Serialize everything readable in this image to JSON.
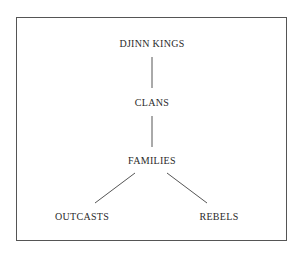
{
  "diagram": {
    "type": "hierarchy",
    "nodes": [
      {
        "id": "djinn_kings",
        "label": "DJINN KINGS"
      },
      {
        "id": "clans",
        "label": "CLANS"
      },
      {
        "id": "families",
        "label": "FAMILIES"
      },
      {
        "id": "outcasts",
        "label": "OUTCASTS"
      },
      {
        "id": "rebels",
        "label": "REBELS"
      }
    ],
    "edges": [
      {
        "from": "djinn_kings",
        "to": "clans"
      },
      {
        "from": "clans",
        "to": "families"
      },
      {
        "from": "families",
        "to": "outcasts"
      },
      {
        "from": "families",
        "to": "rebels"
      }
    ]
  }
}
